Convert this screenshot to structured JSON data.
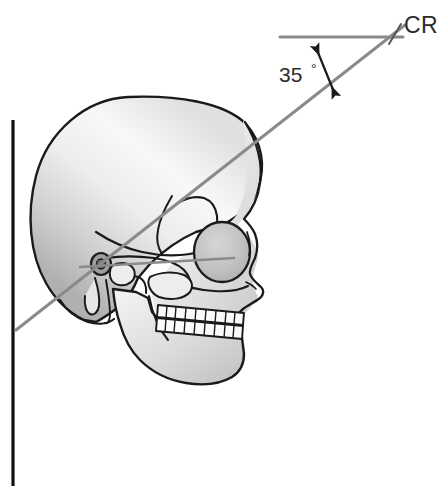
{
  "figure": {
    "background_color": "#ffffff"
  },
  "annotations": {
    "central_ray_label": "CR",
    "angle_value": "35",
    "angle_degree_symbol": "°",
    "angle_full_label": "35°"
  },
  "geometry": {
    "vertical_reference_line": {
      "name": "vertical-image-receptor-line",
      "color": "#111111",
      "x": 13,
      "y_top": 120,
      "y_bottom": 486,
      "width": 3
    },
    "horizontal_reference_line": {
      "name": "horizontal-reference-line",
      "color": "#8a8a8a",
      "x_start": 280,
      "x_end": 402,
      "y": 37,
      "width": 3
    },
    "central_ray_line": {
      "name": "central-ray-line",
      "color": "#8a8a8a",
      "x_start": 16,
      "y_start": 330,
      "x_end": 404,
      "y_end": 26,
      "width": 3,
      "angle_degrees": 35
    },
    "orbitomeatal_line": {
      "name": "orbitomeatal-line",
      "color": "#8a8a8a",
      "x_start": 80,
      "y_start": 266,
      "x_end": 232,
      "y_end": 258,
      "width": 2
    },
    "angle_arrow": {
      "name": "angle-double-arrow",
      "color": "#1a1a1a",
      "x_start": 316,
      "y_start": 46,
      "x_end": 335,
      "y_end": 95
    },
    "cr_tick": {
      "name": "cr-tick-mark",
      "color": "#555555",
      "x_start": 389,
      "y_start": 43,
      "x_end": 400,
      "y_end": 25
    }
  },
  "colors": {
    "outline": "#1a1a1a",
    "bone_light": "#fcfcfc",
    "bone_mid": "#e2e2e2",
    "bone_shadow": "#b9b9b9",
    "orbit_fill": "#c9c9c9",
    "line_gray": "#8a8a8a",
    "text": "#2b2b2b"
  },
  "anatomy": {
    "parts": [
      {
        "name": "cranial-vault",
        "label": "Cranial vault"
      },
      {
        "name": "frontal-bone",
        "label": "Frontal bone"
      },
      {
        "name": "orbit",
        "label": "Orbit"
      },
      {
        "name": "nasal-profile",
        "label": "Nasal profile"
      },
      {
        "name": "maxilla",
        "label": "Maxilla"
      },
      {
        "name": "upper-teeth",
        "label": "Upper teeth"
      },
      {
        "name": "lower-teeth",
        "label": "Lower teeth"
      },
      {
        "name": "mandible",
        "label": "Mandible"
      },
      {
        "name": "zygomatic-arch",
        "label": "Zygomatic arch"
      },
      {
        "name": "external-auditory-meatus",
        "label": "External auditory meatus"
      },
      {
        "name": "mastoid-process",
        "label": "Mastoid process"
      },
      {
        "name": "styloid-process",
        "label": "Styloid process"
      },
      {
        "name": "occipital-bone",
        "label": "Occipital bone"
      }
    ],
    "upper_teeth_count": 9,
    "lower_teeth_count": 9
  }
}
